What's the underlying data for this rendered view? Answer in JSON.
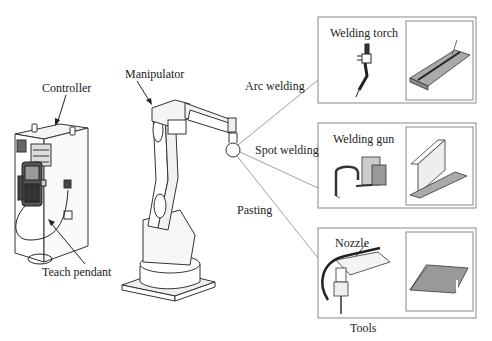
{
  "diagram": {
    "components": {
      "controller": "Controller",
      "teach_pendant": "Teach pendant",
      "manipulator": "Manipulator"
    },
    "applications": [
      {
        "label": "Arc welding",
        "tool": "Welding torch"
      },
      {
        "label": "Spot welding",
        "tool": "Welding gun"
      },
      {
        "label": "Pasting",
        "tool": "Nozzle"
      }
    ],
    "tools_caption": "Tools"
  }
}
